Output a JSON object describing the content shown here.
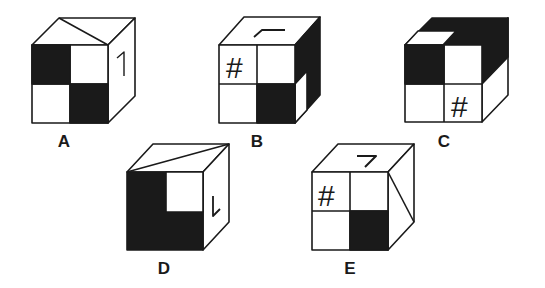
{
  "figure": {
    "type": "cube-folding-puzzle",
    "options": [
      {
        "id": "A",
        "label": "A",
        "front": "checker: black top-left, black bottom-right",
        "top": "diagonal line",
        "right": "1"
      },
      {
        "id": "B",
        "label": "B",
        "front": "# top-left, black bottom-right",
        "top": "⌜ corner mark",
        "right": "black with white lower-left strip"
      },
      {
        "id": "C",
        "label": "C",
        "front": "black top-left, # bottom-right",
        "top": "black with white front-left quarter",
        "right": "black upper, white lower"
      },
      {
        "id": "D",
        "label": "D",
        "front": "black except white top-right",
        "top": "diagonal line",
        "right": "L"
      },
      {
        "id": "E",
        "label": "E",
        "front": "# top-left, black bottom-right",
        "top": "7",
        "right": "diagonal line"
      }
    ],
    "glyphs": {
      "hash": "#",
      "one": "1",
      "seven": "7",
      "el": "L"
    },
    "colors": {
      "ink": "#1a1a1a",
      "paper": "#ffffff"
    }
  }
}
